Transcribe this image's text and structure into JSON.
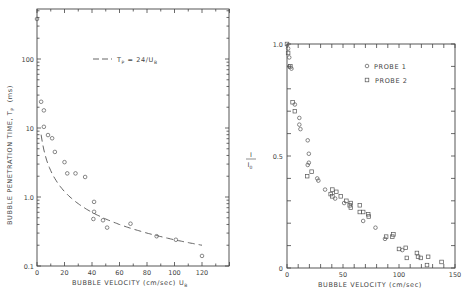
{
  "chart_data": [
    {
      "type": "scatter",
      "title": "",
      "xlabel": "BUBBLE VELOCITY (cm/sec) U_B",
      "ylabel": "BUBBLE PENETRATION TIME, T_P (ms)",
      "yscale": "log",
      "xlim": [
        0,
        140
      ],
      "ylim": [
        0.1,
        500
      ],
      "x_ticks": [
        0,
        20,
        40,
        60,
        80,
        100,
        120
      ],
      "y_ticks": [
        0.1,
        1.0,
        10,
        100
      ],
      "x_tick_labels": [
        "0",
        "20",
        "40",
        "60",
        "80",
        "100",
        "120"
      ],
      "y_tick_labels": [
        "0.1",
        "1.0",
        "10",
        "100"
      ],
      "grid": false,
      "legend": [
        {
          "label": "T_P = 24/U_B",
          "style": "dashed-line"
        }
      ],
      "legend_position": "upper center",
      "series": [
        {
          "name": "Measured",
          "marker": "circle",
          "points": [
            [
              0,
              380
            ],
            [
              3,
              24
            ],
            [
              5,
              18
            ],
            [
              5,
              10.4
            ],
            [
              8,
              7.9
            ],
            [
              11,
              7.1
            ],
            [
              13,
              4.5
            ],
            [
              20,
              3.2
            ],
            [
              22,
              2.2
            ],
            [
              28,
              2.2
            ],
            [
              35,
              1.95
            ],
            [
              41.5,
              0.85
            ],
            [
              41.5,
              0.61
            ],
            [
              41,
              0.48
            ],
            [
              48,
              0.46
            ],
            [
              51,
              0.36
            ],
            [
              68,
              0.41
            ],
            [
              87,
              0.27
            ],
            [
              101,
              0.24
            ],
            [
              120,
              0.14
            ]
          ]
        },
        {
          "name": "T_P = 24/U_B",
          "style": "dashed",
          "function": "24/x",
          "x_range": [
            3,
            120
          ]
        }
      ]
    },
    {
      "type": "scatter",
      "title": "",
      "xlabel": "BUBBLE VELOCITY (cm/sec)",
      "ylabel": "I / I0",
      "xlim": [
        0,
        150
      ],
      "ylim": [
        0,
        1.0
      ],
      "x_ticks": [
        0,
        50,
        100,
        150
      ],
      "y_ticks": [
        0,
        0.5,
        1.0
      ],
      "x_tick_labels": [
        "0",
        "50",
        "100",
        "150"
      ],
      "y_tick_labels": [
        "0",
        "0.5",
        "1.0"
      ],
      "grid": false,
      "legend": [
        {
          "label": "PROBE 1",
          "marker": "circle"
        },
        {
          "label": "PROBE 2",
          "marker": "square"
        }
      ],
      "legend_position": "upper right",
      "series": [
        {
          "name": "PROBE 1",
          "marker": "circle",
          "points": [
            [
              1,
              0.98
            ],
            [
              2,
              0.94
            ],
            [
              2,
              0.9
            ],
            [
              4,
              0.89
            ],
            [
              7,
              0.73
            ],
            [
              11,
              0.67
            ],
            [
              11,
              0.64
            ],
            [
              12,
              0.62
            ],
            [
              18.5,
              0.57
            ],
            [
              19.5,
              0.51
            ],
            [
              19.5,
              0.47
            ],
            [
              18.5,
              0.46
            ],
            [
              27,
              0.4
            ],
            [
              28,
              0.39
            ],
            [
              34,
              0.35
            ],
            [
              43,
              0.31
            ],
            [
              51,
              0.29
            ],
            [
              68,
              0.21
            ],
            [
              79,
              0.18
            ],
            [
              87.5,
              0.13
            ],
            [
              103,
              0.08
            ]
          ]
        },
        {
          "name": "PROBE 2",
          "marker": "square",
          "points": [
            [
              0,
              1.0
            ],
            [
              1,
              0.96
            ],
            [
              3,
              0.9
            ],
            [
              5,
              0.74
            ],
            [
              7,
              0.7
            ],
            [
              22,
              0.43
            ],
            [
              18,
              0.41
            ],
            [
              40.5,
              0.35
            ],
            [
              44,
              0.34
            ],
            [
              39,
              0.33
            ],
            [
              40.5,
              0.32
            ],
            [
              48,
              0.32
            ],
            [
              53,
              0.3
            ],
            [
              57,
              0.29
            ],
            [
              56,
              0.28
            ],
            [
              57,
              0.27
            ],
            [
              65,
              0.28
            ],
            [
              65,
              0.25
            ],
            [
              68,
              0.25
            ],
            [
              72.5,
              0.24
            ],
            [
              73,
              0.23
            ],
            [
              88.5,
              0.14
            ],
            [
              94,
              0.14
            ],
            [
              95,
              0.15
            ],
            [
              100,
              0.085
            ],
            [
              106,
              0.09
            ],
            [
              107,
              0.045
            ],
            [
              116,
              0.067
            ],
            [
              117,
              0.05
            ],
            [
              119.5,
              0.045
            ],
            [
              125,
              0.013
            ],
            [
              126,
              0.05
            ],
            [
              138,
              0.027
            ]
          ]
        }
      ]
    }
  ],
  "labels": {
    "left_xlabel": "BUBBLE VELOCITY (cm/sec)",
    "left_xlabel_sym": "U",
    "left_xlabel_sub": "B",
    "left_ylabel": "BUBBLE PENETRATION TIME, T",
    "left_ylabel_sub": "P",
    "left_ylabel_unit": "(ms)",
    "left_legend": "T",
    "left_legend_sub": "P",
    "left_legend_rest": " = 24/U",
    "left_legend_sub2": "B",
    "right_xlabel": "BUBBLE VELOCITY (cm/sec)",
    "right_ylabel_num": "I",
    "right_ylabel_den": "I",
    "right_ylabel_den_sub": "0",
    "probe1": "PROBE 1",
    "probe2": "PROBE 2"
  }
}
